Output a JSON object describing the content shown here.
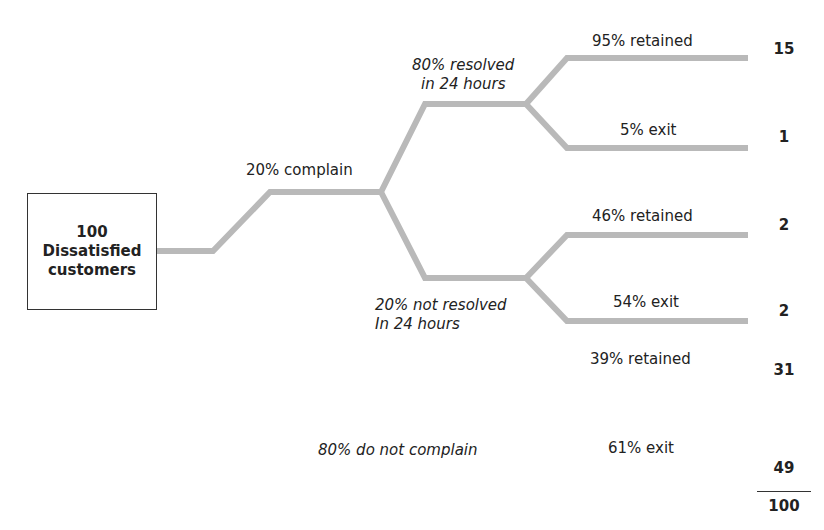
{
  "root": {
    "count": "100",
    "label": "Dissatisfied",
    "label2": "customers"
  },
  "branches": {
    "complain": "20% complain",
    "resolved_line1": "80% resolved",
    "resolved_line2": "in 24 hours",
    "not_resolved_line1": "20% not resolved",
    "not_resolved_line2": "In 24 hours",
    "do_not_complain": "80% do not complain"
  },
  "outcomes": [
    {
      "label": "95% retained",
      "value": "15"
    },
    {
      "label": "5% exit",
      "value": "1"
    },
    {
      "label": "46% retained",
      "value": "2"
    },
    {
      "label": "54% exit",
      "value": "2"
    },
    {
      "label": "39% retained",
      "value": "31"
    },
    {
      "label": "61% exit",
      "value": "49"
    }
  ],
  "total": "100",
  "colors": {
    "line": "#b9b9b9",
    "text": "#222222"
  }
}
